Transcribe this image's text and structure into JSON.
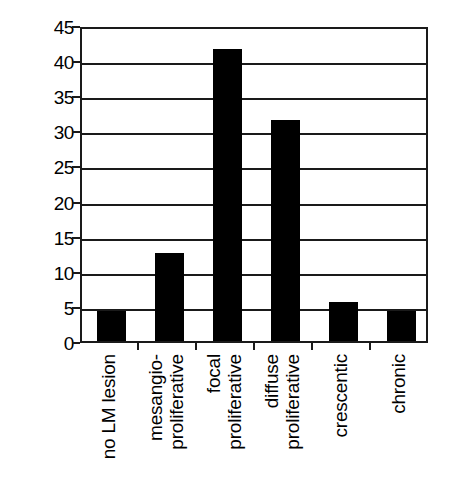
{
  "chart_data": {
    "type": "bar",
    "title": "",
    "subtitle": "",
    "xlabel": "",
    "ylabel": "Percent of specimens",
    "ylim": [
      0,
      45
    ],
    "ytick_step": 5,
    "yticks": [
      0,
      5,
      10,
      15,
      20,
      25,
      30,
      35,
      40,
      45
    ],
    "ytick_labels": [
      "0",
      "5",
      "10",
      "15",
      "20",
      "25",
      "30",
      "35",
      "40",
      "45"
    ],
    "grid": true,
    "grid_axis": "y",
    "legend": false,
    "legend_position": "none",
    "bar_color": "#000000",
    "axis_color": "#1a1a1a",
    "categories": [
      "no LM lesion",
      "mesangio-proliferative",
      "focal proliferative",
      "diffuse proliferative",
      "crescentic",
      "chronic"
    ],
    "category_label_lines": [
      [
        "no LM lesion"
      ],
      [
        "mesangio-",
        "proliferative"
      ],
      [
        "focal",
        "proliferative"
      ],
      [
        "diffuse",
        "proliferative"
      ],
      [
        "crescentic"
      ],
      [
        "chronic"
      ]
    ],
    "values": [
      4.5,
      12.8,
      41.8,
      31.8,
      5.8,
      4.5
    ]
  }
}
